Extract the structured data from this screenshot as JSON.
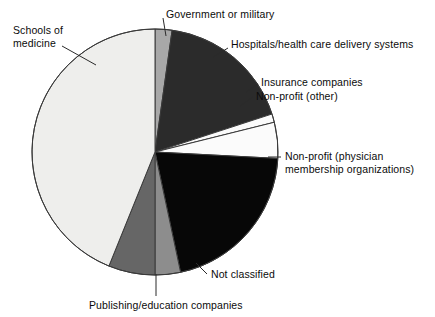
{
  "chart_data": {
    "type": "pie",
    "title": "",
    "subtitle": "",
    "xlabel": "",
    "ylabel": "",
    "legend_position": "none",
    "grid": false,
    "label_style": "leader-lines-to-slices",
    "start_angle_deg": 0,
    "direction": "clockwise",
    "categories": [
      "Government or military",
      "Hospitals/health care delivery systems",
      "Insurance companies",
      "Non-profit (other)",
      "Non-profit (physician membership organizations)",
      "Not classified",
      "Publishing/education companies",
      "Schools of medicine"
    ],
    "values": [
      2.2,
      17.8,
      1.1,
      4.7,
      20.8,
      3.3,
      6.1,
      44.0
    ],
    "slices": [
      {
        "label": "Government or military",
        "value": 2.2,
        "start_deg": 0,
        "end_deg": 8,
        "color": "#a8a8a8"
      },
      {
        "label": "Hospitals/health care delivery systems",
        "value": 17.8,
        "start_deg": 8,
        "end_deg": 72,
        "color": "#2b2b2b"
      },
      {
        "label": "Insurance companies",
        "value": 1.1,
        "start_deg": 72,
        "end_deg": 76,
        "color": "#fbfbfb"
      },
      {
        "label": "Non-profit (other)",
        "value": 4.7,
        "start_deg": 76,
        "end_deg": 93,
        "color": "#fbfbfb"
      },
      {
        "label": "Non-profit (physician membership organizations)",
        "value": 20.8,
        "start_deg": 93,
        "end_deg": 168,
        "color": "#070707"
      },
      {
        "label": "Not classified",
        "value": 3.3,
        "start_deg": 168,
        "end_deg": 180,
        "color": "#8d8d8d"
      },
      {
        "label": "Publishing/education companies",
        "value": 6.1,
        "start_deg": 180,
        "end_deg": 202,
        "color": "#666666"
      },
      {
        "label": "Schools of medicine",
        "value": 44.0,
        "start_deg": 202,
        "end_deg": 360,
        "color": "#eeeeec"
      }
    ]
  },
  "labels": {
    "schools_of_medicine_line1": "Schools of",
    "schools_of_medicine_line2": "medicine",
    "government_or_military": "Government or military",
    "hospitals": "Hospitals/health care delivery systems",
    "insurance_companies": "Insurance companies",
    "non_profit_other": "Non-profit (other)",
    "non_profit_physician_line1": "Non-profit (physician",
    "non_profit_physician_line2": "membership organizations)",
    "not_classified": "Not classified",
    "publishing_education": "Publishing/education companies"
  },
  "colors": {
    "background": "#ffffff",
    "outline": "#3a3a3a",
    "leader_line": "#2a2a2a",
    "text": "#0b0b0b"
  },
  "geometry": {
    "center_x": 155,
    "center_y": 152,
    "radius": 123
  }
}
